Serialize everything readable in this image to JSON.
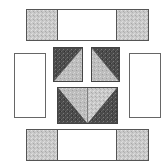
{
  "diagram": {
    "colors": {
      "light_gray": "#c9c9c9",
      "dark": "#4a4a4a",
      "mid_light": "#bdbdbd",
      "white": "#ffffff",
      "outline": "#555555"
    },
    "pieces": {
      "top_bar": {
        "x": 26,
        "y": 9,
        "w": 123,
        "h": 32,
        "end_square_w": 31,
        "fabric_ends": "light-gray",
        "fabric_center": "white"
      },
      "left_rect": {
        "x": 14,
        "y": 53,
        "w": 32,
        "h": 65,
        "fabric": "white"
      },
      "right_rect": {
        "x": 129,
        "y": 53,
        "w": 32,
        "h": 65,
        "fabric": "white"
      },
      "hst_top_left": {
        "x": 53,
        "y": 47,
        "w": 30,
        "h": 35,
        "dark_corner": "top-left",
        "light_corner": "bottom-right"
      },
      "hst_top_right": {
        "x": 91,
        "y": 47,
        "w": 29,
        "h": 35,
        "dark_corner": "top-right",
        "light_corner": "bottom-left"
      },
      "flying_geese": {
        "x": 57,
        "y": 87,
        "w": 61,
        "h": 37,
        "center": "light inverted triangle split vertically",
        "sides": "dark"
      },
      "bottom_bar": {
        "x": 26,
        "y": 129,
        "w": 123,
        "h": 32,
        "end_square_w": 31,
        "fabric_ends": "light-gray",
        "fabric_center": "white"
      }
    }
  }
}
